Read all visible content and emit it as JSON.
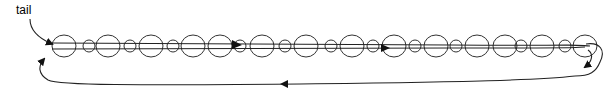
{
  "diagram": {
    "labels": {
      "tail": "tail"
    },
    "colors": {
      "stroke": "#333333",
      "arrow": "#111111",
      "background": "#ffffff"
    },
    "beads": [
      {
        "cx": 64,
        "r": 12
      },
      {
        "cx": 89,
        "r": 6
      },
      {
        "cx": 108,
        "r": 12
      },
      {
        "cx": 130,
        "r": 6
      },
      {
        "cx": 151,
        "r": 12
      },
      {
        "cx": 173,
        "r": 6
      },
      {
        "cx": 193,
        "r": 12
      },
      {
        "cx": 220,
        "r": 12
      },
      {
        "cx": 240,
        "r": 6
      },
      {
        "cx": 262,
        "r": 12
      },
      {
        "cx": 285,
        "r": 6
      },
      {
        "cx": 306,
        "r": 12
      },
      {
        "cx": 331,
        "r": 6
      },
      {
        "cx": 352,
        "r": 12
      },
      {
        "cx": 373,
        "r": 6
      },
      {
        "cx": 394,
        "r": 12
      },
      {
        "cx": 415,
        "r": 6
      },
      {
        "cx": 436,
        "r": 12
      },
      {
        "cx": 456,
        "r": 6
      },
      {
        "cx": 477,
        "r": 12
      },
      {
        "cx": 505,
        "r": 12
      },
      {
        "cx": 521,
        "r": 6
      },
      {
        "cx": 542,
        "r": 12
      },
      {
        "cx": 565,
        "r": 6
      },
      {
        "cx": 585,
        "r": 12
      }
    ],
    "arrows": [
      "tail-pointer",
      "forward-arrow-1",
      "forward-arrow-2",
      "turn-arrow-right",
      "return-arrow-bottom",
      "return-arrow-left"
    ]
  }
}
